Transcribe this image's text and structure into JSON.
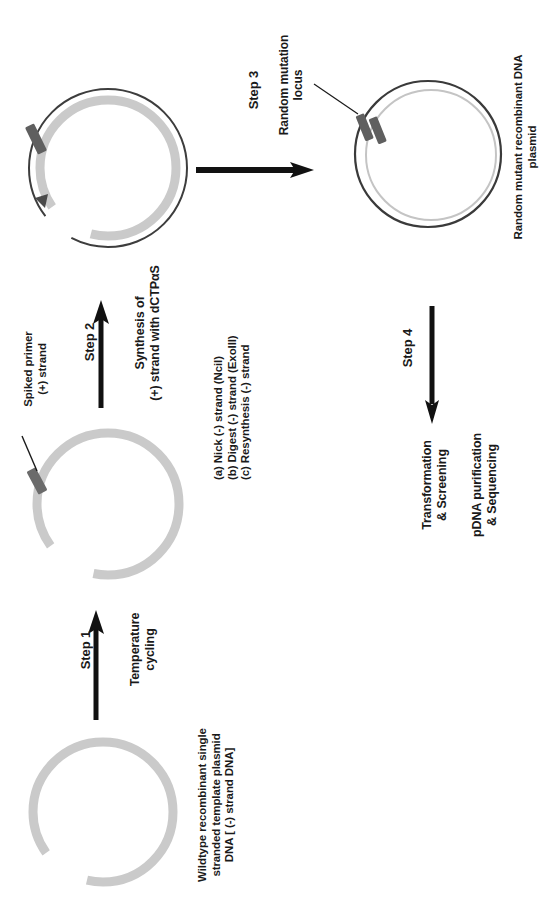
{
  "figure": {
    "type": "diagram",
    "orientation": "all text rotated 90 degrees counter-clockwise (reads bottom-to-top)",
    "background_color": "#ffffff",
    "ink_color": "#1a1a1a",
    "template_strand_color": "#c9c9c9",
    "new_strand_color": "#3d3d3d",
    "primer_block_color": "#6b6b6b",
    "mutation_mark_color": "#5f5f5f"
  },
  "panels": {
    "plasmid_1": {
      "name": "wildtype-ss-template-plasmid",
      "caption_lines": [
        "Wildtype recombinant single",
        "stranded template plasmid",
        "DNA [ (-) strand DNA]"
      ]
    },
    "plasmid_2": {
      "name": "template-with-annealed-primer",
      "annotation_lines": [
        "Spiked primer",
        "(+) strand"
      ]
    },
    "plasmid_3": {
      "name": "heteroduplex-after-synthesis"
    },
    "plasmid_4": {
      "name": "random-mutant-recombinant-plasmid",
      "annotation_lines": [
        "Random mutation",
        "locus"
      ],
      "caption_lines": [
        "Random mutant recombinant DNA",
        "plasmid"
      ]
    }
  },
  "steps": [
    {
      "id": "step-1",
      "label": "Step 1",
      "arrow_direction": "right",
      "description_lines": [
        "Temperature",
        "cycling"
      ]
    },
    {
      "id": "step-2",
      "label": "Step 2",
      "arrow_direction": "right",
      "description_lines": [
        "Synthesis of",
        "(+) strand with dCTPαS"
      ]
    },
    {
      "id": "step-3",
      "label": "Step 3",
      "arrow_direction": "right",
      "description_lines": [
        "(a) Nick (-) strand (NciI)",
        "(b) Digest (-) strand (ExoIII)",
        "(c) Resynthesis (-) strand"
      ]
    },
    {
      "id": "step-4",
      "label": "Step 4",
      "arrow_direction": "down",
      "description_lines": [
        "Transformation",
        "& Screening"
      ],
      "description_lines_2": [
        "pDNA purification",
        "& Sequencing"
      ]
    }
  ]
}
